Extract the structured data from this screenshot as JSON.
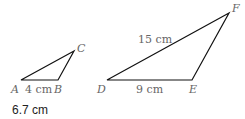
{
  "diagram": {
    "triangle_abc": {
      "vertices": {
        "A": {
          "label": "A",
          "x": 21,
          "y": 80
        },
        "B": {
          "label": "B",
          "x": 58,
          "y": 80
        },
        "C": {
          "label": "C",
          "x": 74,
          "y": 51
        }
      },
      "side_ab": "4 cm"
    },
    "triangle_def": {
      "vertices": {
        "D": {
          "label": "D",
          "x": 107,
          "y": 80
        },
        "E": {
          "label": "E",
          "x": 192,
          "y": 80
        },
        "F": {
          "label": "F",
          "x": 229,
          "y": 13
        }
      },
      "side_de": "9 cm",
      "side_df": "15 cm"
    },
    "line_color": "#111111"
  },
  "answer": "6.7 cm"
}
